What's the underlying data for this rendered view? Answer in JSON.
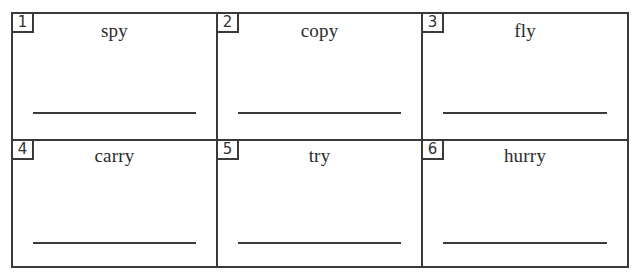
{
  "worksheet": {
    "cells": [
      {
        "number": "1",
        "word": "spy"
      },
      {
        "number": "2",
        "word": "copy"
      },
      {
        "number": "3",
        "word": "fly"
      },
      {
        "number": "4",
        "word": "carry"
      },
      {
        "number": "5",
        "word": "try"
      },
      {
        "number": "6",
        "word": "hurry"
      }
    ]
  }
}
